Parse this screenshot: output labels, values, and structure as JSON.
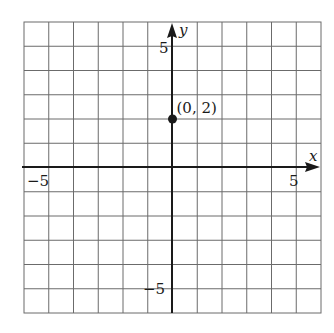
{
  "chart_data": {
    "type": "scatter",
    "title": "",
    "xlabel": "x",
    "ylabel": "y",
    "xlim": [
      -6,
      6
    ],
    "ylim": [
      -6,
      6
    ],
    "grid": true,
    "grid_step": 1,
    "x_tick_labels": [
      {
        "value": -5,
        "label": "−5"
      },
      {
        "value": 5,
        "label": "5"
      }
    ],
    "y_tick_labels": [
      {
        "value": 5,
        "label": "5"
      },
      {
        "value": -5,
        "label": "−5"
      }
    ],
    "series": [
      {
        "name": "point",
        "points": [
          {
            "x": 0,
            "y": 2,
            "label": "(0, 2)"
          }
        ]
      }
    ],
    "legend": null
  },
  "colors": {
    "grid": "#6b6b6b",
    "axis": "#1a1a1a",
    "point": "#1a1a1a",
    "background": "#ffffff"
  },
  "labels": {
    "x_axis_name": "x",
    "y_axis_name": "y",
    "x_tick_neg5": "−5",
    "x_tick_pos5": "5",
    "y_tick_pos5": "5",
    "y_tick_neg5": "−5",
    "point_label": "(0, 2)"
  }
}
